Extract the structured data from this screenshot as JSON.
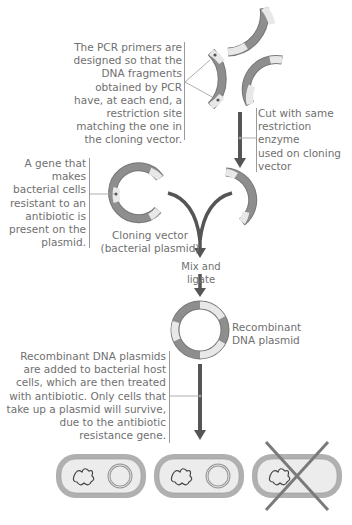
{
  "labels": {
    "pcr_primers": [
      "The PCR primers are",
      "designed so that the",
      "DNA fragments",
      "obtained by PCR",
      "have, at each end, a",
      "restriction site",
      "matching the one in",
      "the cloning vector."
    ],
    "cut_enzyme": [
      "Cut with same",
      "restriction",
      "enzyme",
      "used on cloning",
      "vector"
    ],
    "resistance_gene": [
      "A gene that",
      "makes",
      "bacterial cells",
      "resistant to an",
      "antibiotic is",
      "present on the",
      "plasmid."
    ],
    "cloning_vector": [
      "Cloning vector",
      "(bacterial plasmid)"
    ],
    "mix_ligate": "Mix and ligate",
    "recombinant": [
      "Recombinant",
      "DNA plasmid"
    ],
    "host_cells": [
      "Recombinant DNA plasmids",
      "are added to bacterial host",
      "cells, which are then treated",
      "with antibiotic. Only cells that",
      "take up a plasmid will survive,",
      "due to the antibiotic",
      "resistance gene."
    ]
  },
  "colors": {
    "dna_dark": "#8c8c8c",
    "dna_light": "#e6e6e6",
    "arrow": "#555555",
    "text": "#707070",
    "cell_outer": "#a8a8a8",
    "cell_inner": "#ececec",
    "cross": "#7a7a7a"
  },
  "cells": [
    {
      "state": "survives",
      "has_plasmid": true
    },
    {
      "state": "survives",
      "has_plasmid": true
    },
    {
      "state": "dies",
      "has_plasmid": false
    }
  ]
}
